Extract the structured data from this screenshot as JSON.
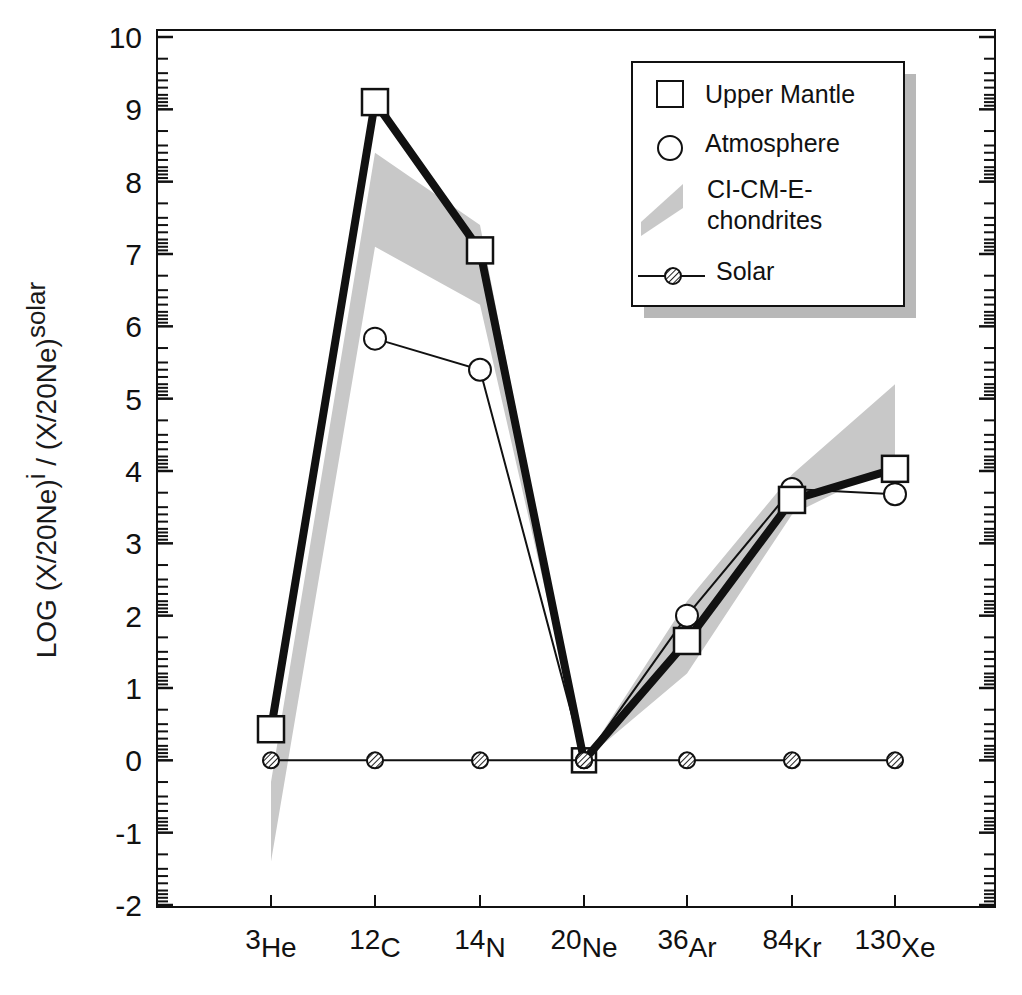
{
  "chart_data": {
    "type": "line",
    "title": "",
    "xlabel": "",
    "ylabel": "LOG (X/20Ne)i / (X/20Ne)solar",
    "ylabel_parts": {
      "main": "LOG (X/20Ne)",
      "sup1": "i",
      "mid": " / (X/20Ne)",
      "sup2": "solar"
    },
    "categories": [
      "3He",
      "12C",
      "14N",
      "20Ne",
      "36Ar",
      "84Kr",
      "130Xe"
    ],
    "category_parts": [
      {
        "mass": "3",
        "el": "He"
      },
      {
        "mass": "12",
        "el": "C"
      },
      {
        "mass": "14",
        "el": "N"
      },
      {
        "mass": "20",
        "el": "Ne"
      },
      {
        "mass": "36",
        "el": "Ar"
      },
      {
        "mass": "84",
        "el": "Kr"
      },
      {
        "mass": "130",
        "el": "Xe"
      }
    ],
    "ylim": [
      -2,
      10
    ],
    "yticks": [
      -2,
      -1,
      0,
      1,
      2,
      3,
      4,
      5,
      6,
      7,
      8,
      9,
      10
    ],
    "grid": false,
    "legend_position": "upper right",
    "series": [
      {
        "name": "Upper Mantle",
        "marker": "square",
        "line": "thick",
        "values": [
          0.43,
          9.1,
          7.05,
          0.0,
          1.65,
          3.6,
          4.03
        ]
      },
      {
        "name": "Atmosphere",
        "marker": "circle",
        "line": "thin",
        "values": [
          null,
          5.83,
          5.4,
          0.0,
          2.0,
          3.75,
          3.68
        ]
      },
      {
        "name": "Solar",
        "marker": "hatched-circle",
        "line": "thin",
        "values": [
          0,
          0,
          0,
          0,
          0,
          0,
          0
        ]
      }
    ],
    "band": {
      "name": "CI-CM-E-chondrites",
      "color": "#c8c8c8",
      "upper": [
        -0.3,
        8.4,
        7.4,
        0.0,
        2.2,
        3.95,
        5.2
      ],
      "lower": [
        -1.4,
        7.1,
        6.3,
        0.0,
        1.2,
        3.4,
        4.1
      ]
    }
  },
  "legend": {
    "items": [
      {
        "label": "Upper Mantle",
        "symbol": "square"
      },
      {
        "label": "Atmosphere",
        "symbol": "circle"
      },
      {
        "label": "CI-CM-E-",
        "label2": "chondrites",
        "symbol": "band"
      },
      {
        "label": "Solar",
        "symbol": "hatched-circle-line"
      }
    ]
  },
  "colors": {
    "line": "#111111",
    "band": "#c8c8c8",
    "shadow": "#b8b8b8",
    "background": "#ffffff"
  }
}
